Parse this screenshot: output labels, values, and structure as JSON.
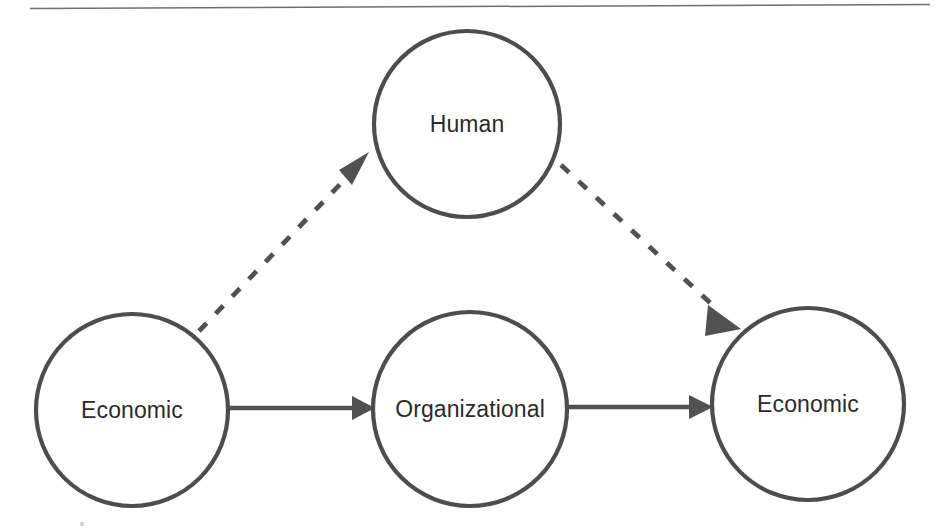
{
  "document": {
    "type": "diagram",
    "background_color": "#ffffff",
    "title_rule": {
      "name": "horizontal-rule",
      "color": "#6f6f6f"
    }
  },
  "diagram": {
    "style": {
      "node_stroke_color": "#4d4d4d",
      "node_fill_color": "#ffffff",
      "edge_color": "#515151",
      "label_color": "#2b2b2b"
    },
    "nodes": [
      {
        "id": "human",
        "label": "Human",
        "cx": 467,
        "cy": 124,
        "r": 93,
        "label_dy": 8
      },
      {
        "id": "economic-left",
        "label": "Economic",
        "cx": 132,
        "cy": 410,
        "r": 96,
        "label_dy": 8
      },
      {
        "id": "organizational",
        "label": "Organizational",
        "cx": 470,
        "cy": 409,
        "r": 97,
        "label_dy": 8
      },
      {
        "id": "economic-right",
        "label": "Economic",
        "cx": 808,
        "cy": 404,
        "r": 96,
        "label_dy": 8
      }
    ],
    "edges": [
      {
        "id": "economic-left-to-organizational",
        "from": "economic-left",
        "to": "organizational",
        "style": "solid",
        "x1": 229,
        "y1": 408,
        "x2": 372,
        "y2": 408
      },
      {
        "id": "organizational-to-economic-right",
        "from": "organizational",
        "to": "economic-right",
        "style": "solid",
        "x1": 568,
        "y1": 407,
        "x2": 710,
        "y2": 407
      },
      {
        "id": "economic-left-to-human",
        "from": "economic-left",
        "to": "human",
        "style": "dashed",
        "x1": 199,
        "y1": 331,
        "x2": 366,
        "y2": 158
      },
      {
        "id": "human-to-economic-right",
        "from": "human",
        "to": "economic-right",
        "style": "dashed",
        "x1": 561,
        "y1": 165,
        "x2": 738,
        "y2": 328
      }
    ]
  }
}
